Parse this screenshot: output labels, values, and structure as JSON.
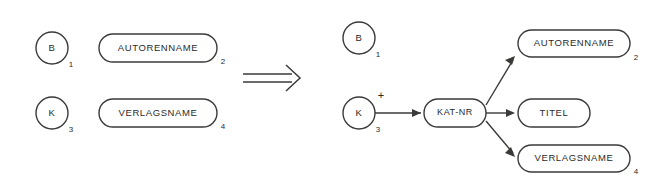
{
  "diagram": {
    "type": "transformation-diagram",
    "left_side": {
      "nodes": [
        {
          "id": "b-circle",
          "shape": "circle",
          "label": "B",
          "index": "1"
        },
        {
          "id": "autorenname-rounded",
          "shape": "rounded",
          "label": "AUTORENNAME",
          "index": "2"
        },
        {
          "id": "k-circle",
          "shape": "circle",
          "label": "K",
          "index": "3"
        },
        {
          "id": "verlagsname-rounded",
          "shape": "rounded",
          "label": "VERLAGSNAME",
          "index": "4"
        }
      ]
    },
    "transform_symbol": "double-arrow-right",
    "right_side": {
      "nodes": [
        {
          "id": "b-circle-2",
          "shape": "circle",
          "label": "B",
          "index": "1"
        },
        {
          "id": "k-circle-2",
          "shape": "circle",
          "label": "K",
          "index": "3",
          "annotation": "+"
        },
        {
          "id": "kat-nr-rounded",
          "shape": "rounded",
          "label": "KAT-NR",
          "index": ""
        },
        {
          "id": "autorenname-rounded-2",
          "shape": "rounded",
          "label": "AUTORENNAME",
          "index": "2"
        },
        {
          "id": "titel-rounded",
          "shape": "rounded",
          "label": "TITEL",
          "index": ""
        },
        {
          "id": "verlagsname-rounded-2",
          "shape": "rounded",
          "label": "VERLAGSNAME",
          "index": "4"
        }
      ],
      "edges": [
        {
          "from": "k-circle-2",
          "to": "kat-nr-rounded",
          "arrow": true
        },
        {
          "from": "kat-nr-rounded",
          "to": "autorenname-rounded-2",
          "arrow": true
        },
        {
          "from": "kat-nr-rounded",
          "to": "titel-rounded",
          "arrow": true
        },
        {
          "from": "kat-nr-rounded",
          "to": "verlagsname-rounded-2",
          "arrow": true
        }
      ]
    },
    "colors": {
      "stroke": "#3a3a38",
      "fill": "#ffffff",
      "text": "#2b2b2a"
    }
  }
}
